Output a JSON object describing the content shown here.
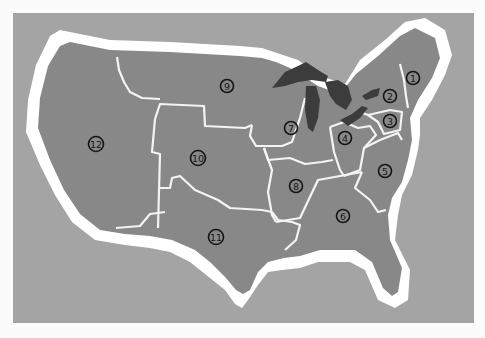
{
  "map": {
    "subject": "Contiguous United States divided into 12 numbered districts",
    "colors": {
      "page_background": "#fbfbfb",
      "sea_background": "#a4a4a4",
      "coast_halo": "#ffffff",
      "land": "#888888",
      "region_border": "#f4f4f4",
      "great_lakes": "#3c3c3c",
      "marker_ink": "#151515"
    },
    "regions": [
      {
        "id": 1,
        "label": "1",
        "area": "New England"
      },
      {
        "id": 2,
        "label": "2",
        "area": "New York"
      },
      {
        "id": 3,
        "label": "3",
        "area": "Pennsylvania / New Jersey"
      },
      {
        "id": 4,
        "label": "4",
        "area": "Ohio / Kentucky"
      },
      {
        "id": 5,
        "label": "5",
        "area": "Mid-Atlantic / Carolinas"
      },
      {
        "id": 6,
        "label": "6",
        "area": "Southeast"
      },
      {
        "id": 7,
        "label": "7",
        "area": "Upper Midwest / Great Lakes"
      },
      {
        "id": 8,
        "label": "8",
        "area": "Mid-South"
      },
      {
        "id": 9,
        "label": "9",
        "area": "Northern Plains"
      },
      {
        "id": 10,
        "label": "10",
        "area": "Central Plains / Rockies"
      },
      {
        "id": 11,
        "label": "11",
        "area": "Texas / Southwest"
      },
      {
        "id": 12,
        "label": "12",
        "area": "West"
      }
    ],
    "markers": [
      {
        "label": "1",
        "x": 413,
        "y": 78
      },
      {
        "label": "2",
        "x": 390,
        "y": 96
      },
      {
        "label": "3",
        "x": 390,
        "y": 121
      },
      {
        "label": "4",
        "x": 345,
        "y": 138
      },
      {
        "label": "5",
        "x": 385,
        "y": 171
      },
      {
        "label": "6",
        "x": 343,
        "y": 216
      },
      {
        "label": "7",
        "x": 291,
        "y": 128
      },
      {
        "label": "8",
        "x": 296,
        "y": 186
      },
      {
        "label": "9",
        "x": 227,
        "y": 86
      },
      {
        "label": "10",
        "x": 198,
        "y": 158
      },
      {
        "label": "11",
        "x": 216,
        "y": 237
      },
      {
        "label": "12",
        "x": 96,
        "y": 144
      }
    ]
  }
}
